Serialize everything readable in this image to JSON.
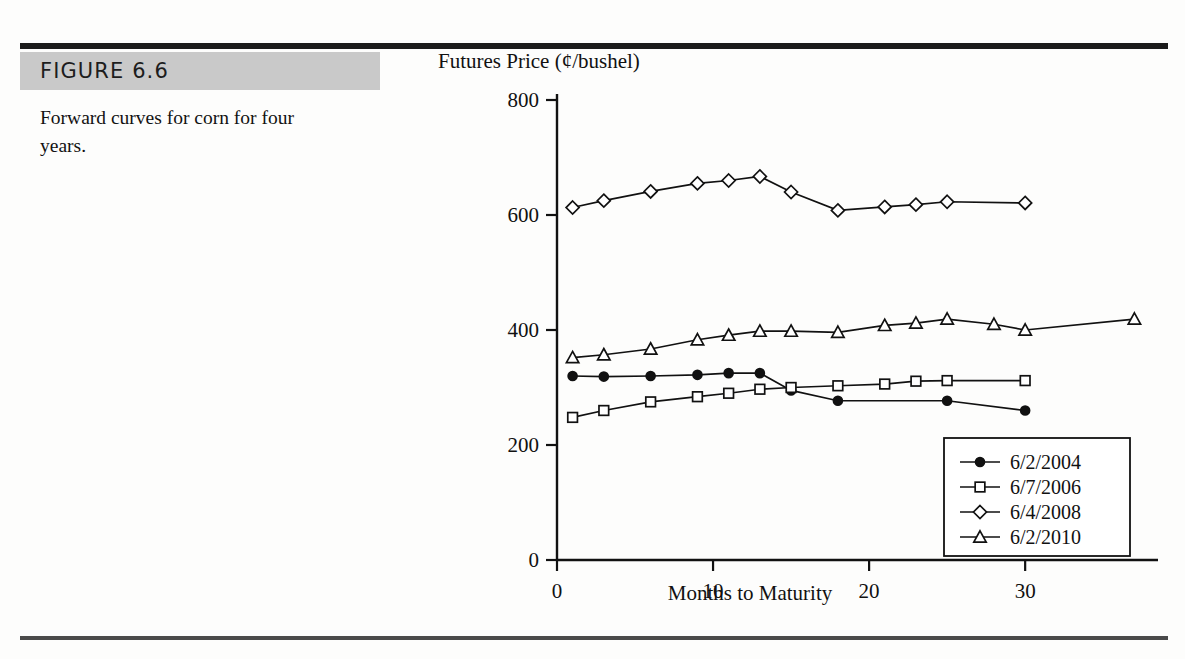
{
  "figure": {
    "label": "FIGURE 6.6",
    "caption": "Forward curves for corn for four years."
  },
  "chart_data": {
    "type": "line",
    "title": "",
    "xlabel": "Months to Maturity",
    "ylabel": "Futures Price (¢/bushel)",
    "xlim": [
      0,
      38
    ],
    "ylim": [
      0,
      800
    ],
    "xticks": [
      0,
      10,
      20,
      30
    ],
    "yticks": [
      0,
      200,
      400,
      600,
      800
    ],
    "grid": false,
    "legend_position": "bottom-right",
    "series": [
      {
        "name": "6/2/2004",
        "marker": "filled-circle",
        "x": [
          1,
          3,
          6,
          9,
          11,
          13,
          15,
          18,
          25,
          30
        ],
        "values": [
          320,
          319,
          320,
          322,
          325,
          325,
          295,
          277,
          277,
          260
        ]
      },
      {
        "name": "6/7/2006",
        "marker": "open-square",
        "x": [
          1,
          3,
          6,
          9,
          11,
          13,
          15,
          18,
          21,
          23,
          25,
          30
        ],
        "values": [
          248,
          260,
          275,
          284,
          290,
          297,
          300,
          303,
          306,
          311,
          312,
          312
        ]
      },
      {
        "name": "6/4/2008",
        "marker": "open-diamond",
        "x": [
          1,
          3,
          6,
          9,
          11,
          13,
          15,
          18,
          21,
          23,
          25,
          30
        ],
        "values": [
          613,
          625,
          641,
          655,
          660,
          667,
          640,
          608,
          614,
          618,
          623,
          621
        ]
      },
      {
        "name": "6/2/2010",
        "marker": "open-triangle",
        "x": [
          1,
          3,
          6,
          9,
          11,
          13,
          15,
          18,
          21,
          23,
          25,
          28,
          30,
          37
        ],
        "values": [
          352,
          357,
          367,
          383,
          391,
          398,
          398,
          396,
          408,
          412,
          419,
          410,
          400,
          419
        ]
      }
    ]
  }
}
